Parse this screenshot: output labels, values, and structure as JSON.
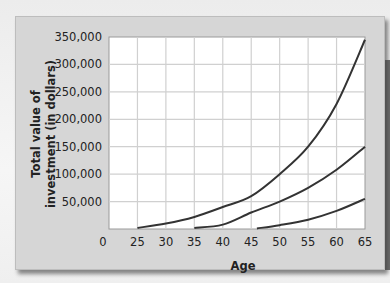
{
  "chart_data": {
    "type": "line",
    "title": "",
    "xlabel": "Age",
    "ylabel": "Total value of investment (in dollars)",
    "ylabel_lines": [
      "Total value of",
      "investment (in dollars)"
    ],
    "x_ticks": [
      "0",
      "25",
      "30",
      "35",
      "40",
      "45",
      "50",
      "55",
      "60",
      "65"
    ],
    "y_ticks": [
      "50,000",
      "100,000",
      "150,000",
      "200,000",
      "250,000",
      "300,000",
      "350,000"
    ],
    "xlim": [
      20,
      65
    ],
    "ylim": [
      0,
      350000
    ],
    "grid": true,
    "legend": null,
    "series": [
      {
        "name": "Start at age 25",
        "x": [
          25,
          30,
          35,
          40,
          45,
          50,
          55,
          60,
          65
        ],
        "values": [
          2000,
          10000,
          22000,
          40000,
          60000,
          100000,
          150000,
          228000,
          345000
        ]
      },
      {
        "name": "Start at age 35",
        "x": [
          35,
          40,
          45,
          50,
          55,
          60,
          65
        ],
        "values": [
          2000,
          8000,
          30000,
          50000,
          75000,
          108000,
          150000
        ]
      },
      {
        "name": "Start at age 46",
        "x": [
          46,
          50,
          55,
          60,
          65
        ],
        "values": [
          1000,
          7000,
          17000,
          33000,
          55000
        ]
      }
    ]
  },
  "colors": {
    "panel": "#d6d6d6",
    "plot_bg": "#ffffff",
    "grid": "#d0d0d0",
    "curve": "#333333",
    "text": "#222222"
  }
}
